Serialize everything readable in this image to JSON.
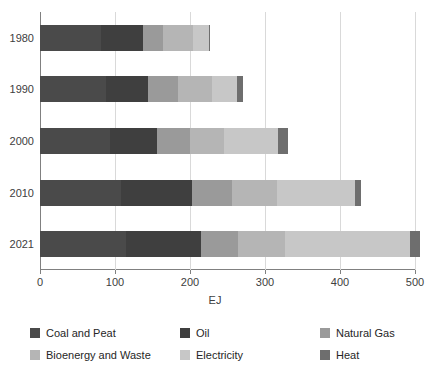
{
  "chart_data": {
    "type": "bar",
    "orientation": "horizontal",
    "stacked": true,
    "title": "",
    "xlabel": "EJ",
    "ylabel": "",
    "xlim": [
      0,
      500
    ],
    "xticks": [
      0,
      100,
      200,
      300,
      400,
      500
    ],
    "xtick_labels": [
      "0",
      "100",
      "200",
      "300",
      "400",
      "500"
    ],
    "grid": true,
    "legend_position": "bottom",
    "categories": [
      "1980",
      "1990",
      "2000",
      "2010",
      "2021"
    ],
    "series": [
      {
        "name": "Coal and Peat",
        "color": "#4a4a4a",
        "values": [
          81,
          88,
          93,
          108,
          115
        ]
      },
      {
        "name": "Oil",
        "color": "#3f3f3f",
        "values": [
          56,
          56,
          63,
          95,
          100
        ]
      },
      {
        "name": "Natural Gas",
        "color": "#9a9a9a",
        "values": [
          27,
          40,
          44,
          53,
          49
        ]
      },
      {
        "name": "Bioenergy and Waste",
        "color": "#b5b5b5",
        "values": [
          40,
          45,
          45,
          60,
          62
        ]
      },
      {
        "name": "Electricity",
        "color": "#c7c7c7",
        "values": [
          21,
          33,
          72,
          104,
          167
        ]
      },
      {
        "name": "Heat",
        "color": "#6e6e6e",
        "values": [
          1,
          9,
          14,
          8,
          13
        ]
      }
    ],
    "totals": [
      226,
      271,
      331,
      428,
      506
    ],
    "annotations": []
  },
  "legend": {
    "items": [
      {
        "label": "Coal and Peat"
      },
      {
        "label": "Oil"
      },
      {
        "label": "Natural Gas"
      },
      {
        "label": "Bioenergy and Waste"
      },
      {
        "label": "Electricity"
      },
      {
        "label": "Heat"
      }
    ]
  }
}
